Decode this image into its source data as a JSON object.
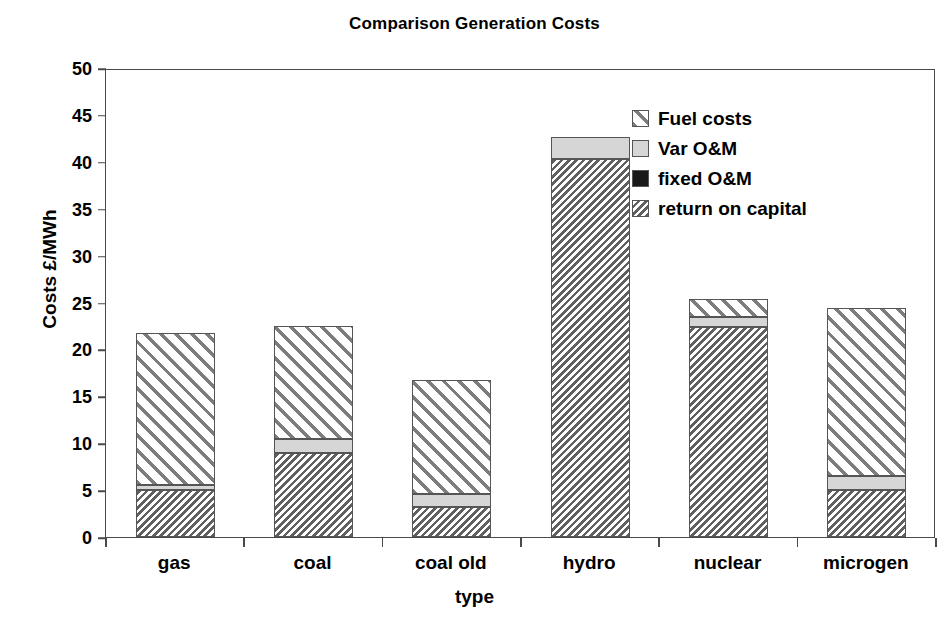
{
  "chart_data": {
    "type": "bar",
    "stacked": true,
    "title": "Comparison Generation Costs",
    "xlabel": "type",
    "ylabel": "Costs £/MWh",
    "categories": [
      "gas",
      "coal",
      "coal old",
      "hydro",
      "nuclear",
      "microgen"
    ],
    "ylim": [
      0,
      50
    ],
    "ytick_step": 5,
    "ytick_labels": [
      "0",
      "5",
      "10",
      "15",
      "20",
      "25",
      "30",
      "35",
      "40",
      "45",
      "50"
    ],
    "grid": false,
    "legend_position": "inside-top-right",
    "series": [
      {
        "name": "return on capital",
        "pattern": "back-diagonal-dense-hatch",
        "color": "#606060",
        "values": [
          5.0,
          9.0,
          3.2,
          40.3,
          22.4,
          5.0
        ]
      },
      {
        "name": "fixed O&M",
        "pattern": "solid-black",
        "color": "#1a1a1a",
        "values": [
          0,
          0,
          0,
          0,
          0,
          0
        ]
      },
      {
        "name": "Var O&M",
        "pattern": "solid-light-grey",
        "color": "#d6d6d6",
        "values": [
          0.5,
          1.5,
          1.4,
          2.3,
          1.1,
          1.5
        ]
      },
      {
        "name": "Fuel costs",
        "pattern": "forward-diagonal-hatch",
        "color": "#7d7d7d",
        "values": [
          16.3,
          12.0,
          12.1,
          0.0,
          1.9,
          17.9
        ]
      }
    ],
    "totals": [
      21.8,
      22.5,
      16.7,
      42.6,
      25.4,
      24.4
    ]
  },
  "legend": {
    "entries": [
      {
        "label": "Fuel costs",
        "swatch": "fuel-costs-swatch"
      },
      {
        "label": "Var O&M",
        "swatch": "var-om-swatch"
      },
      {
        "label": "fixed O&M",
        "swatch": "fixed-om-swatch"
      },
      {
        "label": "return on capital",
        "swatch": "return-on-capital-swatch"
      }
    ]
  }
}
